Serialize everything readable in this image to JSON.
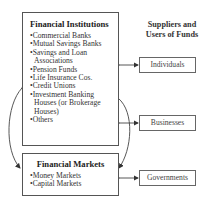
{
  "institutions": {
    "title": "Financial Institutions",
    "items": [
      "•Commercial Banks",
      "•Mutual Savings Banks",
      "•Savings and Loan",
      "Associations",
      "•Pension Funds",
      "•Life Insurance Cos.",
      "•Credit Unions",
      "•Investment Banking",
      "Houses (or Brokerage",
      "Houses)",
      "•Others"
    ]
  },
  "markets": {
    "title": "Financial Markets",
    "items": [
      "•Money Markets",
      "•Capital Markets"
    ]
  },
  "participants": {
    "header_line1": "Suppliers and",
    "header_line2": "Users of Funds",
    "individuals": "Individuals",
    "businesses": "Businesses",
    "governments": "Governments"
  }
}
